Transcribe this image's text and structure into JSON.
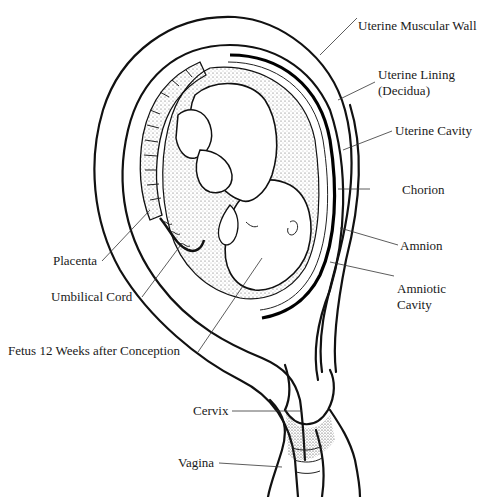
{
  "diagram": {
    "labels": {
      "uterine_muscular_wall": "Uterine Muscular Wall",
      "uterine_lining_line1": "Uterine Lining",
      "uterine_lining_line2": "(Decidua)",
      "uterine_cavity": "Uterine Cavity",
      "chorion": "Chorion",
      "amnion": "Amnion",
      "amniotic_cavity_line1": "Amniotic",
      "amniotic_cavity_line2": "Cavity",
      "placenta": "Placenta",
      "umbilical_cord": "Umbilical Cord",
      "fetus": "Fetus 12 Weeks after Conception",
      "cervix": "Cervix",
      "vagina": "Vagina"
    },
    "colors": {
      "line": "#111111",
      "background": "#ffffff",
      "stipple": "#555555"
    }
  }
}
